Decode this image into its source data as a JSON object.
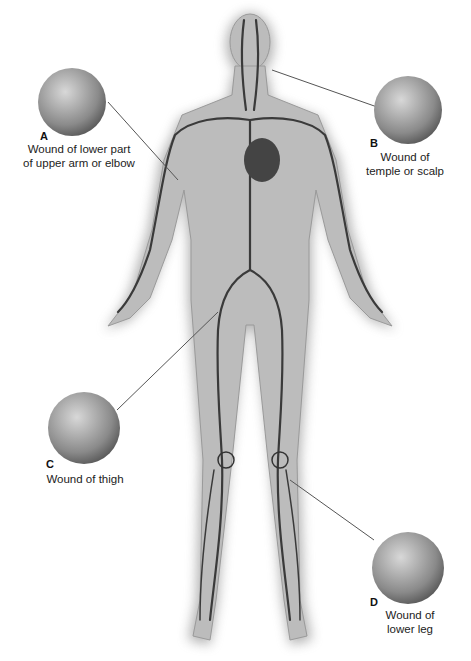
{
  "figure": {
    "type": "anatomical-diagram",
    "colors": {
      "body": "#b8b8b8",
      "vessel": "#333333",
      "callout": "#777777",
      "background": "#ffffff"
    }
  },
  "callouts": [
    {
      "letter": "A",
      "line1": "Wound of lower part",
      "line2": "of upper arm or elbow"
    },
    {
      "letter": "B",
      "line1": "Wound of",
      "line2": "temple or scalp"
    },
    {
      "letter": "C",
      "line1": "Wound of thigh",
      "line2": ""
    },
    {
      "letter": "D",
      "line1": "Wound of",
      "line2": "lower leg"
    }
  ]
}
